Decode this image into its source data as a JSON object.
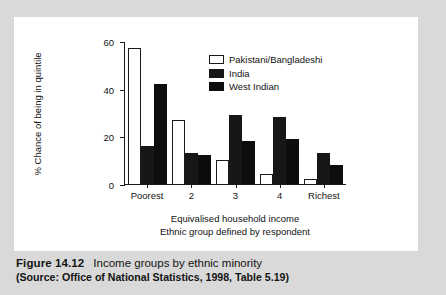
{
  "figure": {
    "number_label": "Figure 14.12",
    "title": "Income groups by ethnic minority",
    "source": "(Source: Office of National Statistics, 1998, Table 5.19)"
  },
  "chart_data": {
    "type": "bar",
    "title": "",
    "xlabel": "Equivalised household income",
    "xlabel_line2": "Ethnic group defined by respondent",
    "ylabel": "% Chance of being in quintile",
    "categories": [
      "Poorest",
      "2",
      "3",
      "4",
      "Richest"
    ],
    "series": [
      {
        "name": "Pakistani/Bangladeshi",
        "color": "#ffffff",
        "values": [
          57,
          27,
          10,
          4,
          2
        ]
      },
      {
        "name": "India",
        "color": "#171717",
        "values": [
          16,
          13,
          29,
          28,
          13
        ]
      },
      {
        "name": "West Indian",
        "color": "#0d0d0d",
        "values": [
          42,
          12,
          18,
          19,
          8
        ]
      }
    ],
    "ylim": [
      0,
      60
    ],
    "yticks": [
      0,
      20,
      40,
      60
    ],
    "ytick_labels": [
      "0",
      "20",
      "40",
      "60"
    ],
    "grid": false,
    "legend_position": "top-right"
  },
  "colors": {
    "page_background": "#d9d9d9",
    "panel_background": "#ffffff",
    "ink": "#121212"
  }
}
